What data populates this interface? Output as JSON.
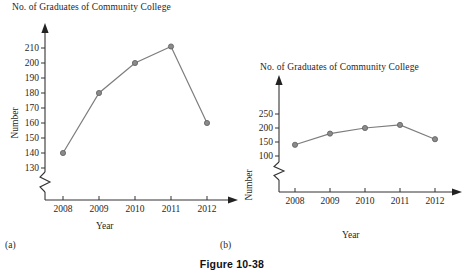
{
  "figure": {
    "caption": "Figure 10-38"
  },
  "panels": [
    {
      "key": "a",
      "caption": "(a)",
      "title": "No. of Graduates of Community College",
      "xlabel": "Year",
      "ylabel": "Number"
    },
    {
      "key": "b",
      "caption": "(b)",
      "title": "No. of Graduates of Community College",
      "xlabel": "Year",
      "ylabel": "Number"
    }
  ],
  "chart_data": [
    {
      "type": "line",
      "panel": "(a)",
      "title": "No. of Graduates of Community College",
      "xlabel": "Year",
      "ylabel": "Number",
      "categories": [
        "2008",
        "2009",
        "2010",
        "2011",
        "2012"
      ],
      "values": [
        140,
        180,
        200,
        211,
        160
      ],
      "yticks": [
        130,
        140,
        150,
        160,
        170,
        180,
        190,
        200,
        210
      ],
      "ylim": [
        130,
        215
      ],
      "axis_break": true,
      "axis_break_note": "y-axis truncated below 130 (zigzag break)",
      "grid": false,
      "legend": "none",
      "marker": "circle",
      "line_color": "#7d7d7d"
    },
    {
      "type": "line",
      "panel": "(b)",
      "title": "No. of Graduates of Community College",
      "xlabel": "Year",
      "ylabel": "Number",
      "categories": [
        "2008",
        "2009",
        "2010",
        "2011",
        "2012"
      ],
      "values": [
        140,
        180,
        200,
        211,
        160
      ],
      "yticks": [
        100,
        150,
        200,
        250
      ],
      "ylim": [
        100,
        275
      ],
      "axis_break": true,
      "axis_break_note": "y-axis truncated below 100 (zigzag break)",
      "grid": false,
      "legend": "none",
      "marker": "circle",
      "line_color": "#7d7d7d"
    }
  ]
}
